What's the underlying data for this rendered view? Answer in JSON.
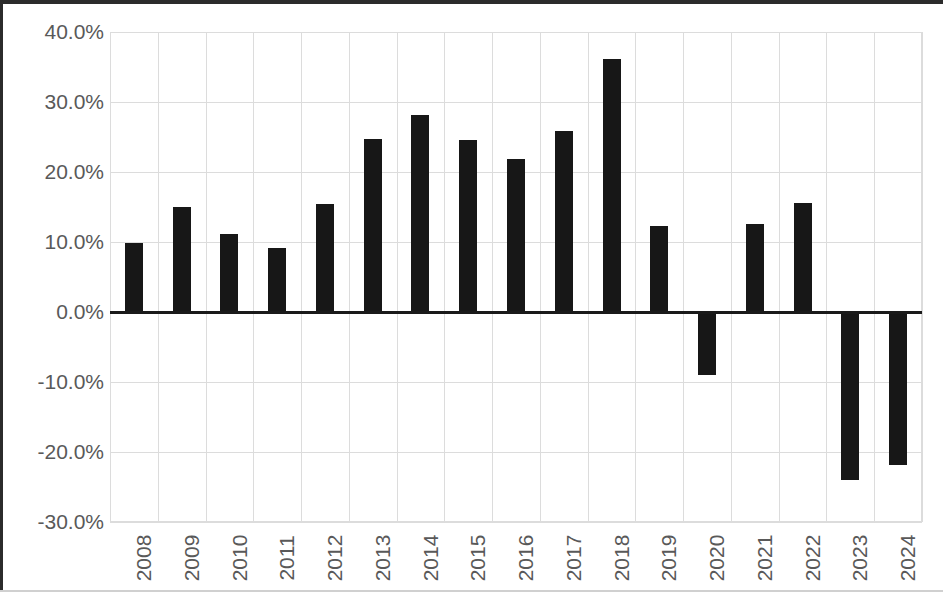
{
  "chart_data": {
    "type": "bar",
    "title": "",
    "subtitle": "",
    "xlabel": "",
    "ylabel": "",
    "categories": [
      "2008",
      "2009",
      "2010",
      "2011",
      "2012",
      "2013",
      "2014",
      "2015",
      "2016",
      "2017",
      "2018",
      "2019",
      "2020",
      "2021",
      "2022",
      "2023",
      "2024"
    ],
    "values": [
      9.8,
      15.0,
      11.2,
      9.1,
      15.4,
      24.7,
      28.2,
      24.6,
      21.9,
      25.8,
      36.2,
      12.3,
      -9.0,
      12.6,
      15.6,
      -24.0,
      -21.8
    ],
    "value_unit": "%",
    "ylim": [
      -30,
      40
    ],
    "ytick_labels": [
      "40.0%",
      "30.0%",
      "20.0%",
      "10.0%",
      "0.0%",
      "-10.0%",
      "-20.0%",
      "-30.0%"
    ],
    "ytick_values": [
      40,
      30,
      20,
      10,
      0,
      -10,
      -20,
      -30
    ],
    "grid": true,
    "grid_axis": "both",
    "legend": false,
    "legend_position": "none",
    "series": [
      {
        "name": "Annual change",
        "values": [
          9.8,
          15.0,
          11.2,
          9.1,
          15.4,
          24.7,
          28.2,
          24.6,
          21.9,
          25.8,
          36.2,
          12.3,
          -9.0,
          12.6,
          15.6,
          -24.0,
          -21.8
        ]
      }
    ]
  },
  "style": {
    "bar_color": "#171717",
    "grid_color": "#dcdcdc",
    "axis_text_color": "#595959",
    "zero_line_color": "#1a1a1a",
    "background": "#ffffff",
    "frame_color": "#2b2b2b"
  }
}
